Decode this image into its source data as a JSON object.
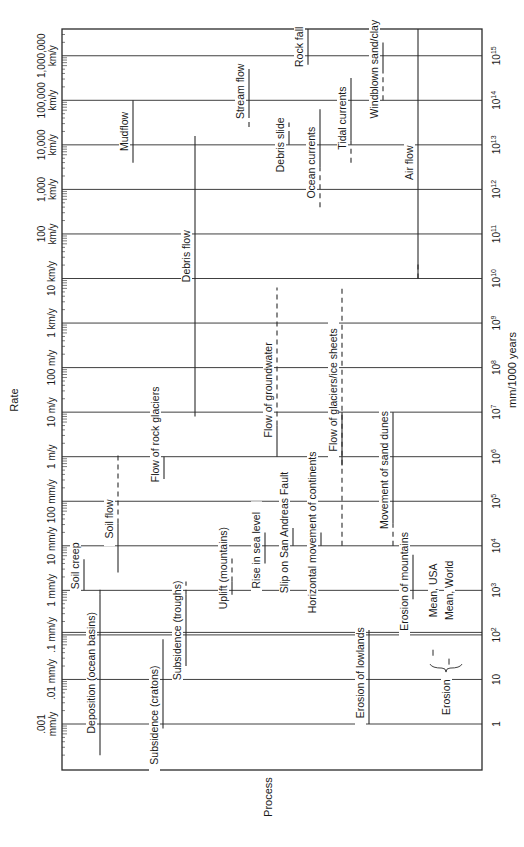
{
  "chart_data": {
    "type": "range",
    "orientation": "rotated-90-ccw",
    "title": "",
    "xlabel": "Process",
    "ylabel_left": "Rate",
    "ylabel_right": "mm/1000 years",
    "scale": "log10",
    "ylim_log10": [
      -0.6,
      15.6
    ],
    "right_ticks": [
      {
        "exp": 0,
        "label": "1",
        "sup": ""
      },
      {
        "exp": 1,
        "label": "10",
        "sup": ""
      },
      {
        "exp": 2,
        "label": "10",
        "sup": "2"
      },
      {
        "exp": 3,
        "label": "10",
        "sup": "3"
      },
      {
        "exp": 4,
        "label": "10",
        "sup": "4"
      },
      {
        "exp": 5,
        "label": "10",
        "sup": "5"
      },
      {
        "exp": 6,
        "label": "10",
        "sup": "6"
      },
      {
        "exp": 7,
        "label": "10",
        "sup": "7"
      },
      {
        "exp": 8,
        "label": "10",
        "sup": "8"
      },
      {
        "exp": 9,
        "label": "10",
        "sup": "9"
      },
      {
        "exp": 10,
        "label": "10",
        "sup": "10"
      },
      {
        "exp": 11,
        "label": "10",
        "sup": "11"
      },
      {
        "exp": 12,
        "label": "10",
        "sup": "12"
      },
      {
        "exp": 13,
        "label": "10",
        "sup": "13"
      },
      {
        "exp": 14,
        "label": "10",
        "sup": "14"
      },
      {
        "exp": 15,
        "label": "10",
        "sup": "15"
      }
    ],
    "left_ticks": [
      {
        "exp": 0,
        "line1": ".001",
        "line2": "mm/y"
      },
      {
        "exp": 1,
        "line1": "",
        "line2": ".01 mm/y"
      },
      {
        "exp": 2,
        "line1": "",
        "line2": ".1 mm/y"
      },
      {
        "exp": 3,
        "line1": "",
        "line2": "1 mm/y"
      },
      {
        "exp": 4,
        "line1": "",
        "line2": "10 mm/y"
      },
      {
        "exp": 5,
        "line1": "",
        "line2": "100 mm/y"
      },
      {
        "exp": 6,
        "line1": "",
        "line2": "1 m/y"
      },
      {
        "exp": 7,
        "line1": "",
        "line2": "10 m/y"
      },
      {
        "exp": 8,
        "line1": "",
        "line2": "100 m/y"
      },
      {
        "exp": 9,
        "line1": "",
        "line2": "1 km/y"
      },
      {
        "exp": 10,
        "line1": "",
        "line2": "10 km/y"
      },
      {
        "exp": 11,
        "line1": "100",
        "line2": "km/y"
      },
      {
        "exp": 12,
        "line1": "1,000",
        "line2": "km/y"
      },
      {
        "exp": 13,
        "line1": "10,000",
        "line2": "km/y"
      },
      {
        "exp": 14,
        "line1": "100,000",
        "line2": "km/y"
      },
      {
        "exp": 15,
        "line1": "1,000,000",
        "line2": "km/y"
      }
    ],
    "processes": [
      {
        "name": "Soil creep",
        "x": 84,
        "solid": [
          3.0,
          3.7
        ],
        "dashed": [],
        "label_exp": 3.55
      },
      {
        "name": "Deposition (ocean basins)",
        "x": 100,
        "solid": [
          -0.7,
          2.9
        ],
        "dashed": [
          2.9,
          3.1
        ],
        "label_exp": 1.15
      },
      {
        "name": "Soil flow",
        "x": 118,
        "solid": [
          3.4,
          4.5
        ],
        "dashed": [
          4.5,
          6.1
        ],
        "label_exp": 4.6
      },
      {
        "name": "Mudflow",
        "x": 133,
        "solid": [
          12.6,
          14.0
        ],
        "dashed": [],
        "label_exp": 13.3
      },
      {
        "name": "Subsidence (cratons)",
        "x": 163,
        "solid": [
          -0.1,
          1.9
        ],
        "dashed": [],
        "label_exp": 0.2
      },
      {
        "name": "Flow of rock glaciers",
        "x": 164,
        "solid": [
          5.5,
          6.0
        ],
        "dashed": [],
        "label_exp": 6.5
      },
      {
        "name": "Subsidence (troughs)",
        "x": 186,
        "solid": [
          1.3,
          2.9
        ],
        "dashed": [
          2.9,
          3.2
        ],
        "label_exp": 2.1
      },
      {
        "name": "Debris flow",
        "x": 195,
        "solid": [
          6.9,
          13.2
        ],
        "dashed": [],
        "label_exp": 10.5
      },
      {
        "name": "Uplift (mountains)",
        "x": 232,
        "solid": [
          2.9,
          3.2
        ],
        "dashed": [
          3.2,
          3.8
        ],
        "label_exp": 3.5
      },
      {
        "name": "Stream flow",
        "x": 249,
        "solid": [
          13.6,
          14.7
        ],
        "dashed": [
          13.4,
          13.6
        ],
        "label_exp": 14.2
      },
      {
        "name": "Rise in sea level",
        "x": 265,
        "solid": [
          3.6,
          4.3
        ],
        "dashed": [],
        "label_exp": 3.9
      },
      {
        "name": "Flow of groundwater",
        "x": 277,
        "solid": [
          6.0,
          6.7
        ],
        "dashed": [
          6.7,
          9.8
        ],
        "label_exp": 7.5
      },
      {
        "name": "Debris slide",
        "x": 289,
        "solid": [
          13.0,
          13.2
        ],
        "dashed": [
          13.2,
          13.5
        ],
        "label_exp": 13.0
      },
      {
        "name": "Slip on San Andreas Fault",
        "x": 293,
        "solid": [
          4.0,
          4.4
        ],
        "dashed": [],
        "label_exp": 4.3
      },
      {
        "name": "Rock fall",
        "x": 308,
        "solid": [
          14.8,
          15.6
        ],
        "dashed": [],
        "label_exp": 15.2
      },
      {
        "name": "Ocean currents",
        "x": 320,
        "solid": [
          12.5,
          13.8
        ],
        "dashed": [
          11.6,
          12.5
        ],
        "label_exp": 12.6
      },
      {
        "name": "Horizontal movement of continents",
        "x": 321,
        "solid": [
          4.0,
          4.3
        ],
        "dashed": [],
        "label_exp": 4.3
      },
      {
        "name": "Flow of glaciers/ice sheets",
        "x": 342,
        "solid": [
          5.8,
          7.0
        ],
        "dashed": [
          4.0,
          9.8
        ],
        "label_exp": 7.5
      },
      {
        "name": "Tidal currents",
        "x": 351,
        "solid": [
          13.1,
          14.5
        ],
        "dashed": [
          12.6,
          13.1
        ],
        "label_exp": 13.6
      },
      {
        "name": "Erosion of lowlands",
        "x": 369,
        "solid": [
          0.0,
          2.0
        ],
        "dashed": [
          2.0,
          2.2
        ],
        "label_exp": 1.15
      },
      {
        "name": "Windblown sand/clay",
        "x": 383,
        "solid": [
          14.6,
          15.3
        ],
        "dashed": [
          14.0,
          14.6
        ],
        "label_exp": 14.7
      },
      {
        "name": "Movement of sand dunes",
        "x": 393,
        "solid": [
          4.5,
          7.0
        ],
        "dashed": [
          4.0,
          4.5
        ],
        "label_exp": 5.7
      },
      {
        "name": "Erosion of mountains",
        "x": 413,
        "solid": [
          2.8,
          3.8
        ],
        "dashed": [],
        "label_exp": 3.2
      },
      {
        "name": "Air flow",
        "x": 418,
        "solid": [
          10.0,
          15.6
        ],
        "dashed": [
          10.0,
          10.4
        ],
        "label_exp": 12.6
      }
    ],
    "erosion_means": {
      "group_label": "Erosion",
      "items": [
        {
          "name": "Mean, USA",
          "x": 437,
          "mark_exp": 1.6
        },
        {
          "name": "Mean, World",
          "x": 453,
          "mark_exp": 1.4
        }
      ]
    }
  }
}
